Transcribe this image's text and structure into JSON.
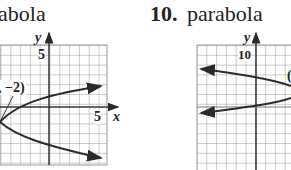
{
  "problems": [
    {
      "number": "",
      "title": "abola",
      "graph": {
        "y_axis_label": "y",
        "x_axis_label": "x",
        "y_tick_label": "5",
        "x_tick_label": "5",
        "vertex_annotation": ", −2)"
      }
    },
    {
      "number": "10.",
      "title": "parabola",
      "graph": {
        "y_axis_label": "y",
        "y_tick_label": "10",
        "partial_annotation": "("
      }
    }
  ],
  "colors": {
    "grid": "#9a9a9a",
    "axis": "#333333",
    "curve": "#2a2a2a"
  }
}
